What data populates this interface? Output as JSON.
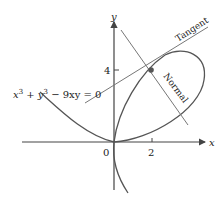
{
  "figure": {
    "equation": "x³ + y³ − 9xy = 0",
    "equation_parts": {
      "x": "x",
      "exp1": "3",
      "plus": " + ",
      "y": "y",
      "exp2": "3",
      "rest": " − 9xy = 0"
    },
    "axes": {
      "x_label": "x",
      "y_label": "y",
      "origin_label": "0"
    },
    "ticks": {
      "x": [
        {
          "value": 2,
          "label": "2"
        }
      ],
      "y": [
        {
          "value": 4,
          "label": "4"
        }
      ]
    },
    "lines": {
      "tangent_label": "Tangent",
      "normal_label": "Normal"
    },
    "point": {
      "x": 2,
      "y": 4
    },
    "tangent_slope": 0.8,
    "normal_slope": -1.25,
    "colors": {
      "curve": "#555555",
      "axes": "#444444",
      "lines": "#777777",
      "point": "#555555"
    }
  }
}
